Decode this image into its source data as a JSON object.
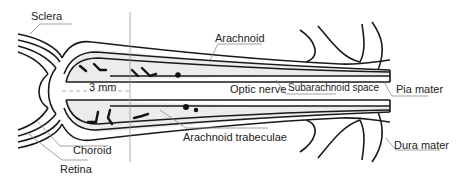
{
  "diagram": {
    "type": "anatomical-cross-section",
    "colors": {
      "line": "#1a1a1a",
      "leader": "#888888",
      "space_fill": "#ededed",
      "trabeculae": "#111111",
      "background": "#ffffff"
    },
    "labels": {
      "sclera": "Sclera",
      "choroid": "Choroid",
      "retina": "Retina",
      "arachnoid": "Arachnoid",
      "optic_nerve": "Optic nerve",
      "subarachnoid_space": "Subarachnoid space",
      "pia_mater": "Pia mater",
      "arachnoid_trabeculae": "Arachnoid trabeculae",
      "dura_mater": "Dura mater",
      "measurement": "3 mm"
    }
  }
}
